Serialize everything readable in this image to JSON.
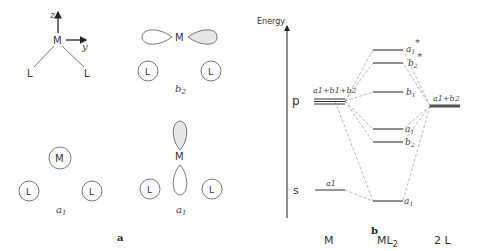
{
  "figure": {
    "panel_a": {
      "caption": "a",
      "axes": {
        "z_label": "z",
        "y_label": "y",
        "metal": "M",
        "ligand": "L"
      },
      "orbital_b2": {
        "metal": "M",
        "ligand_left": "L",
        "ligand_right": "L",
        "symmetry": "b",
        "sub": "2"
      },
      "ligand_a1": {
        "metal": "M",
        "ligand_left": "L",
        "ligand_right": "L",
        "symmetry": "a",
        "sub": "1"
      },
      "orbital_a1": {
        "metal": "M",
        "ligand_left": "L",
        "ligand_right": "L",
        "symmetry": "a",
        "sub": "1"
      }
    },
    "panel_b": {
      "caption": "b",
      "axis_label": "Energy",
      "metal_column": {
        "label": "M",
        "p_label": "p",
        "s_label": "s",
        "p_level_label": "a1+b1+b2",
        "s_level_label": "a1"
      },
      "complex_column": {
        "label": "ML",
        "label_sub": "2",
        "levels": [
          {
            "sym": "a",
            "sub": "1",
            "star": "*"
          },
          {
            "sym": "b",
            "sub": "2",
            "star": "*"
          },
          {
            "sym": "b",
            "sub": "1",
            "star": ""
          },
          {
            "sym": "a",
            "sub": "1",
            "star": ""
          },
          {
            "sym": "b",
            "sub": "2",
            "star": ""
          },
          {
            "sym": "a",
            "sub": "1",
            "star": ""
          }
        ]
      },
      "ligand_column": {
        "label": "2 L",
        "level_label": "a1+b2"
      }
    }
  }
}
